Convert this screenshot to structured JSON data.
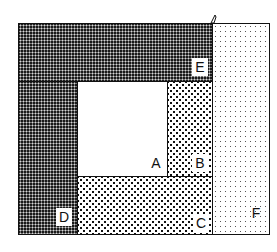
{
  "diagram": {
    "type": "rectangle partition",
    "regions": [
      {
        "id": "A",
        "label": "A",
        "pattern": "none"
      },
      {
        "id": "B",
        "label": "B",
        "pattern": "medium-dots"
      },
      {
        "id": "C",
        "label": "C",
        "pattern": "medium-dots"
      },
      {
        "id": "D",
        "label": "D",
        "pattern": "dense-dark"
      },
      {
        "id": "E",
        "label": "E",
        "pattern": "dense-dark"
      },
      {
        "id": "F",
        "label": "F",
        "pattern": "light-dots"
      }
    ]
  },
  "colors": {
    "outline": "#111111",
    "dark_fill": "#1a1a1a",
    "background": "#ffffff"
  }
}
